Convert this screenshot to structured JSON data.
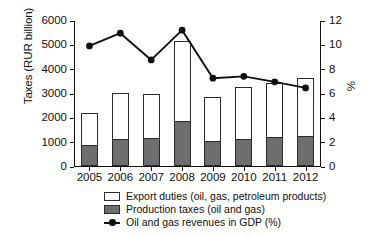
{
  "chart_data": {
    "type": "bar",
    "title": "",
    "subtitle": "",
    "categories": [
      "2005",
      "2006",
      "2007",
      "2008",
      "2009",
      "2010",
      "2011",
      "2012"
    ],
    "xlabel": "",
    "ylabel": "Taxes (RUR billion)",
    "ylabel_right": "%",
    "ylim": [
      0,
      6000
    ],
    "yticks": [
      0,
      1000,
      2000,
      3000,
      4000,
      5000,
      6000
    ],
    "ytick_labels": [
      "0",
      "1000",
      "2000",
      "3000",
      "4000",
      "5000",
      "6000"
    ],
    "ylim_right": [
      0,
      12
    ],
    "yticks_right": [
      0,
      2,
      4,
      6,
      8,
      10,
      12
    ],
    "ytick_labels_right": [
      "0",
      "2",
      "4",
      "6",
      "8",
      "10",
      "12"
    ],
    "grid": false,
    "legend_position": "below-axes",
    "stacked": true,
    "series": [
      {
        "name": "Production taxes (oil and gas)",
        "axis": "left",
        "kind": "bar-segment",
        "color": "#6e6e6e",
        "values": [
          870,
          1130,
          1140,
          1830,
          1030,
          1110,
          1190,
          1230
        ]
      },
      {
        "name": "Export duties (oil, gas, petroleum products)",
        "axis": "left",
        "kind": "bar-segment",
        "color": "#ffffff",
        "values": [
          1300,
          1860,
          1820,
          3300,
          1790,
          2140,
          2230,
          2380
        ]
      },
      {
        "name": "Oil and gas revenues in GDP (%)",
        "axis": "right",
        "kind": "line",
        "color": "#111111",
        "marker": "circle",
        "values": [
          9.95,
          11.0,
          8.8,
          11.25,
          7.3,
          7.45,
          7.0,
          6.5
        ]
      }
    ],
    "bar_totals": [
      2170,
      2990,
      2960,
      5130,
      2820,
      3250,
      3420,
      3610
    ]
  },
  "legend": {
    "items": [
      {
        "swatch": "export-duties-swatch",
        "label": "Export duties (oil, gas, petroleum products)"
      },
      {
        "swatch": "production-taxes-swatch",
        "label": "Production taxes (oil and gas)"
      },
      {
        "swatch": "gdp-line-swatch",
        "label": "Oil and gas revenues in GDP (%)"
      }
    ]
  }
}
